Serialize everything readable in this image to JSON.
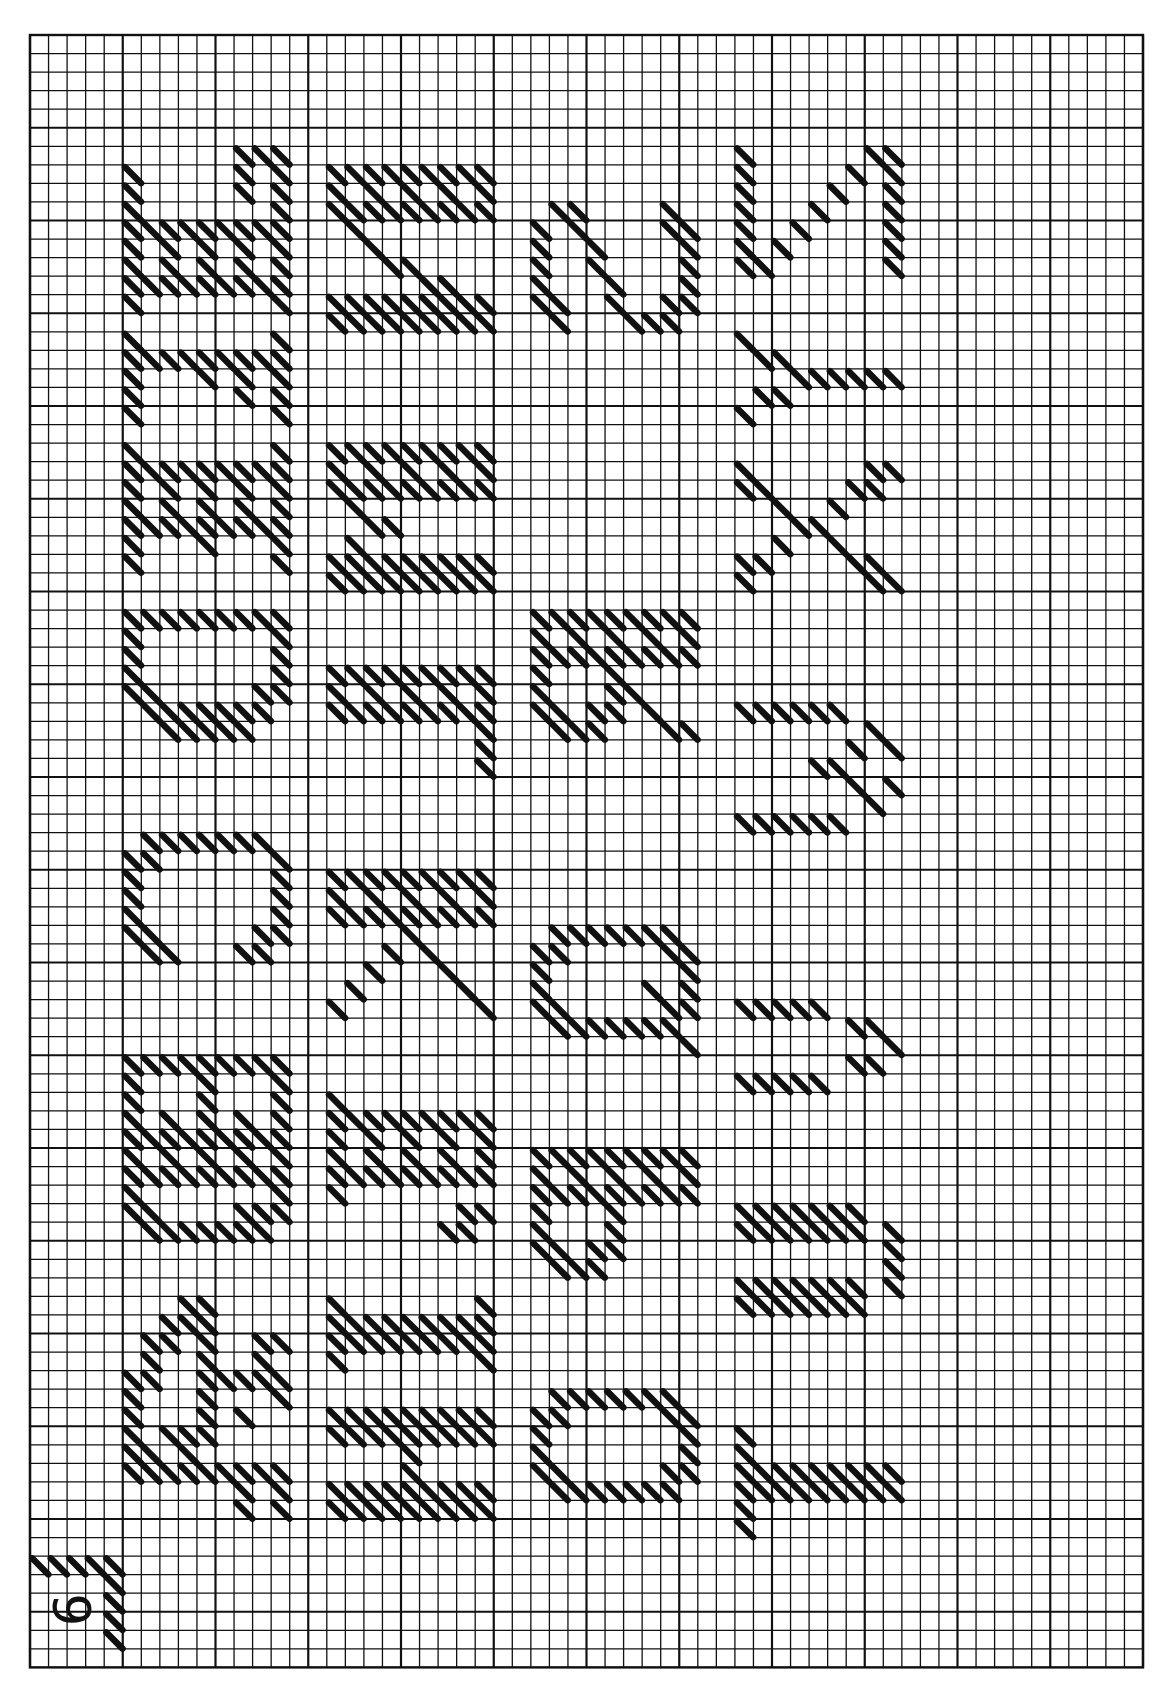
{
  "page": {
    "page_number": "9",
    "background": "#ffffff",
    "ink": "#111111"
  },
  "grid": {
    "origin_x": 30,
    "origin_y": 35,
    "cols": 60,
    "rows": 88,
    "cell": 18.55,
    "major_every": 5,
    "minor_line_width": 1.3,
    "major_line_width": 2.2,
    "border_width": 2.4
  },
  "orientation_note": "Letters drawn rotated 90 degrees counter-clockwise; read bottom-to-top within each band",
  "bands": [
    {
      "name": "band-1",
      "col": 5,
      "letters": "ABCDEFG"
    },
    {
      "name": "band-2",
      "col": 16,
      "letters": "HIJKLMN"
    },
    {
      "name": "band-3",
      "col": 27,
      "letters": "OPQRS"
    },
    {
      "name": "band-4",
      "col": 38,
      "letters": "TUVWXYZ"
    }
  ],
  "glyphs": [
    {
      "letter": "A",
      "band": 0,
      "row": 68,
      "cells": [
        "...##....",
        "..###....",
        ".##.#..##",
        ".#..#..#.",
        "##..#####",
        "#...#...#",
        "#...#.#..",
        "#.###....",
        "##.#.....",
        "#########",
        "......#.#",
        "......#.#"
      ]
    },
    {
      "letter": "B",
      "band": 0,
      "row": 55,
      "cells": [
        "#########",
        "#...#...#",
        "#...#...#",
        "#.#.#.#.#",
        "#########",
        "#.#.#.#.#",
        "#########",
        "#.......#",
        "##....###",
        ".#######."
      ]
    },
    {
      "letter": "C",
      "band": 0,
      "row": 43,
      "cells": [
        ".#######.",
        "##......#",
        "#.......#",
        "#.......#",
        "#.......#",
        "##.....##",
        ".##...##."
      ]
    },
    {
      "letter": "D",
      "band": 0,
      "row": 31,
      "cells": [
        "#########",
        "#.......#",
        "#.......#",
        "#.......#",
        "##.....##",
        ".#######.",
        "..#####.."
      ]
    },
    {
      "letter": "E",
      "band": 0,
      "row": 22,
      "cells": [
        "#.......#",
        "#########",
        "#.#.#.#.#",
        "#.#.#.#.#",
        "#########",
        "#...#...#",
        "#.......#"
      ]
    },
    {
      "letter": "F",
      "band": 0,
      "row": 16,
      "cells": [
        "#.......#",
        "#########",
        "#...#.#.#",
        "#.....#.#",
        "#.......#"
      ]
    },
    {
      "letter": "G",
      "band": 0,
      "row": 6,
      "cells": [
        "......###",
        "#.....#.#",
        "#.....#.#",
        "#.......#",
        "#########",
        "#.#.#.#.#",
        "#.#.#.#.#",
        "#########",
        "#.......#"
      ]
    },
    {
      "letter": "H",
      "band": 1,
      "row": 74,
      "cells": [
        "#########",
        "#########",
        "....#....",
        "....#....",
        "#########",
        "#########"
      ]
    },
    {
      "letter": "I",
      "band": 1,
      "row": 68,
      "cells": [
        "#.......#",
        "#########",
        "#########",
        "#.......#"
      ]
    },
    {
      "letter": "J",
      "band": 1,
      "row": 57,
      "cells": [
        "#........",
        "#########",
        "#.#.#.#.#",
        "#.#.#.#.#",
        "#########",
        "#........",
        ".......##",
        "......##."
      ]
    },
    {
      "letter": "K",
      "band": 1,
      "row": 45,
      "cells": [
        "#########",
        "#.#.#.#.#",
        "#########",
        "....#....",
        "...#.#...",
        "..#...#..",
        ".#.....#.",
        "#.......#"
      ]
    },
    {
      "letter": "L",
      "band": 1,
      "row": 34,
      "cells": [
        "#########",
        "#.#.#.#.#",
        "#########",
        "........#",
        "........#",
        "........#"
      ]
    },
    {
      "letter": "M",
      "band": 1,
      "row": 22,
      "cells": [
        "#########",
        "#.#.#.#.#",
        "#########",
        ".#.......",
        "..##.....",
        ".#.......",
        "#########",
        "#########"
      ]
    },
    {
      "letter": "N",
      "band": 1,
      "row": 7,
      "cells": [
        "#########",
        "#.#.#.#.#",
        "#########",
        ".#.......",
        "..#......",
        "...##....",
        ".....##..",
        "#########",
        "#########"
      ]
    },
    {
      "letter": "O",
      "band": 2,
      "row": 73,
      "cells": [
        ".#######.",
        "##.....##",
        "#.......#",
        "#.......#",
        "##.....##",
        ".#######."
      ]
    },
    {
      "letter": "P",
      "band": 2,
      "row": 60,
      "cells": [
        "#########",
        "#.#.#.#.#",
        "#########",
        "#...#....",
        "#...#....",
        "##.##....",
        ".###....."
      ]
    },
    {
      "letter": "Q",
      "band": 2,
      "row": 48,
      "cells": [
        ".#######.",
        "##.....##",
        "#.......#",
        "#.....#.#",
        "##.....##",
        ".#######.",
        "........#"
      ]
    },
    {
      "letter": "R",
      "band": 2,
      "row": 31,
      "cells": [
        "#########",
        "#.#.#.#.#",
        "#########",
        "#...#....",
        "#...##...",
        "##.##.#..",
        ".###...##"
      ]
    },
    {
      "letter": "S",
      "band": 2,
      "row": 9,
      "cells": [
        ".##....#.",
        "#.#....##",
        "#..#....#",
        "#..#....#",
        "#...#...#",
        "##..#..##",
        ".#...###."
      ]
    },
    {
      "letter": "T",
      "band": 3,
      "row": 75,
      "cells": [
        "#........",
        "#........",
        "#########",
        "#########",
        "#........",
        "#........"
      ]
    },
    {
      "letter": "U",
      "band": 3,
      "row": 63,
      "cells": [
        "#######..",
        "#######.#",
        "........#",
        "........#",
        "#######.#",
        "#######.."
      ]
    },
    {
      "letter": "V",
      "band": 3,
      "row": 52,
      "cells": [
        "#####....",
        "......##.",
        "........#",
        "......##.",
        "#####...."
      ]
    },
    {
      "letter": "W",
      "band": 3,
      "row": 36,
      "cells": [
        "######...",
        ".......#.",
        "......#.#",
        "....##...",
        "......#.#",
        ".......#.",
        "######..."
      ]
    },
    {
      "letter": "X",
      "band": 3,
      "row": 23,
      "cells": [
        "#......##",
        "##....##.",
        "..#..#...",
        "...##....",
        "..#..#...",
        "##....##.",
        "#......##"
      ]
    },
    {
      "letter": "Y",
      "band": 3,
      "row": 16,
      "cells": [
        "#........",
        ".##......",
        "...######",
        ".##......",
        "#........"
      ]
    },
    {
      "letter": "Z",
      "band": 3,
      "row": 6,
      "cells": [
        "#......##",
        "#.....#.#",
        "#....#..#",
        "#...#...#",
        "#..#....#",
        "#.#.....#",
        "##......#"
      ]
    }
  ],
  "page_number_box": {
    "label": "9",
    "top_row": 82,
    "left_col": 0,
    "stitch_row": [
      0,
      1,
      2,
      3,
      4
    ],
    "stitch_col": 4,
    "rows": 5
  }
}
